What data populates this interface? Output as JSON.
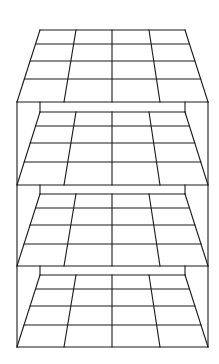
{
  "diagram": {
    "title": "",
    "stroke_color": "#1a1a1a",
    "background_color": "#ffffff",
    "grid_columns": 4,
    "grid_rows": 4,
    "levels": [
      {
        "id": "level-1",
        "top_y": 30,
        "bottom_y": 102,
        "row_ys": [
          30,
          44,
          61,
          79,
          102
        ],
        "has_back_wall": false
      },
      {
        "id": "level-2",
        "top_y": 112,
        "bottom_y": 185,
        "row_ys": [
          112,
          126,
          143,
          162,
          185
        ],
        "has_back_wall": true
      },
      {
        "id": "level-3",
        "top_y": 194,
        "bottom_y": 266,
        "row_ys": [
          194,
          208,
          225,
          244,
          266
        ],
        "has_back_wall": true
      },
      {
        "id": "level-4",
        "top_y": 275,
        "bottom_y": 347,
        "row_ys": [
          275,
          289,
          306,
          325,
          347
        ],
        "has_back_wall": true
      }
    ],
    "geometry": {
      "top_left_x": 40,
      "top_right_x": 185,
      "bottom_left_x": 17,
      "bottom_right_x": 208,
      "top_col_xs": [
        40,
        76,
        112,
        149,
        185
      ],
      "bottom_col_xs": [
        17,
        64,
        112,
        160,
        208
      ],
      "box_top_y": 102,
      "box_bottom_y": 347
    }
  }
}
